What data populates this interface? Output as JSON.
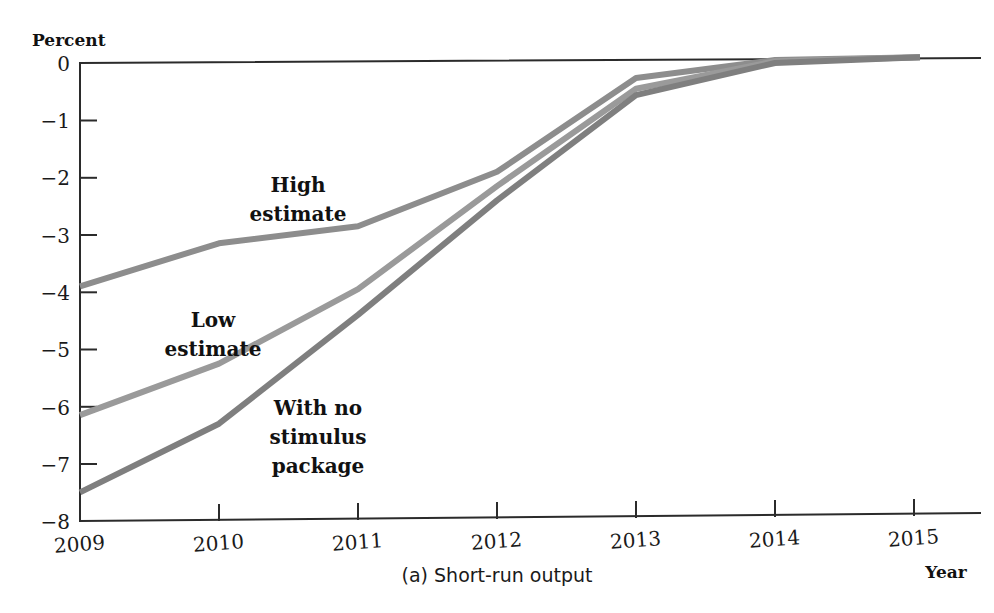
{
  "figure": {
    "caption": "(a) Short-run output",
    "y_axis_title": "Percent",
    "x_axis_title": "Year"
  },
  "chart_data": {
    "type": "line",
    "title": "(a) Short-run output",
    "xlabel": "Year",
    "ylabel": "Percent",
    "x": [
      2009,
      2010,
      2011,
      2012,
      2013,
      2014,
      2015
    ],
    "xtick_labels": [
      "2009",
      "2010",
      "2011",
      "2012",
      "2013",
      "2014",
      "2015"
    ],
    "ytick_labels": [
      "0",
      "−1",
      "−2",
      "−3",
      "−4",
      "−5",
      "−6",
      "−7",
      "−8"
    ],
    "ytick_values": [
      0,
      -1,
      -2,
      -3,
      -4,
      -5,
      -6,
      -7,
      -8
    ],
    "xlim": [
      2009,
      2015
    ],
    "ylim": [
      -8,
      0
    ],
    "grid": false,
    "legend": "inline-annotations",
    "line_color": "#8a8a8a",
    "series": [
      {
        "name": "High estimate",
        "label": "High\nestimate",
        "label_line1": "High",
        "label_line2": "estimate",
        "color": "#8d8d8d",
        "values": [
          -3.9,
          -3.15,
          -2.85,
          -1.9,
          -0.26,
          0.05,
          0.1
        ]
      },
      {
        "name": "Low estimate",
        "label": "Low\nestimate",
        "label_line1": "Low",
        "label_line2": "estimate",
        "color": "#9a9a9a",
        "values": [
          -6.15,
          -5.25,
          -3.95,
          -2.15,
          -0.45,
          0.03,
          0.1
        ]
      },
      {
        "name": "With no stimulus package",
        "label": "With no\nstimulus\npackage",
        "label_line1": "With no",
        "label_line2": "stimulus",
        "label_line3": "package",
        "color": "#7f7f7f",
        "values": [
          -7.5,
          -6.3,
          -4.4,
          -2.4,
          -0.56,
          0.0,
          0.1
        ]
      }
    ]
  }
}
